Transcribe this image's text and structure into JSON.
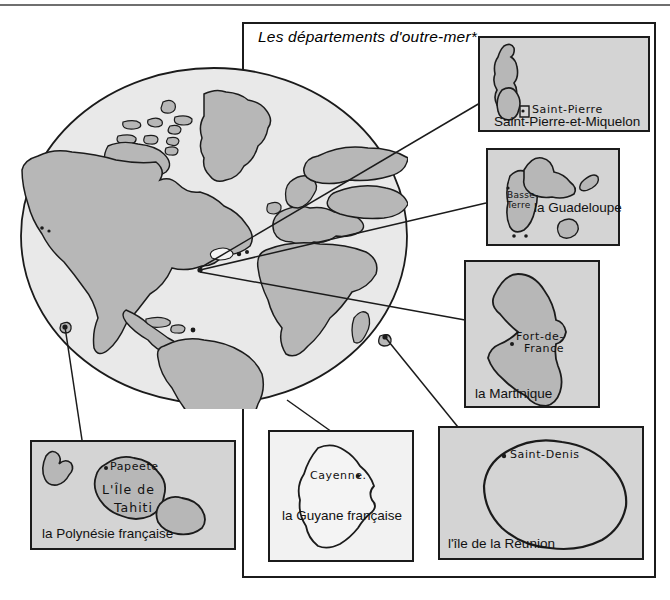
{
  "figure": {
    "title": "Les départements d'outre-mer*",
    "globe_name": "world-globe"
  },
  "insets": [
    {
      "id": "saint-pierre-et-miquelon",
      "label": "Saint-Pierre-et-Miquelon",
      "city": "Saint-Pierre",
      "fill": "#d4d4d4"
    },
    {
      "id": "guadeloupe",
      "label": "la Guadeloupe",
      "city": "Basse-\nTerre",
      "city_line1": "Basse-",
      "city_line2": "Terre",
      "fill": "#d4d4d4"
    },
    {
      "id": "martinique",
      "label": "la Martinique",
      "city_line1": "Fort-de-",
      "city_line2": "France",
      "fill": "#d4d4d4"
    },
    {
      "id": "polynesie-francaise",
      "label": "la Polynésie française",
      "city": "Papeete",
      "island_line1": "L'Île de",
      "island_line2": "Tahiti",
      "fill": "#d4d4d4"
    },
    {
      "id": "guyane-francaise",
      "label": "la Guyane française",
      "city": "Cayenne.",
      "fill": "#e9e9e9"
    },
    {
      "id": "reunion",
      "label": "l'île de la Réunion",
      "city": "Saint-Denis",
      "fill": "#d4d4d4"
    }
  ],
  "colors": {
    "land": "#b7b7b7",
    "ocean": "#e4e4e4",
    "ink": "#1b1b1b",
    "inset_bg": "#d4d4d4",
    "page": "#ffffff"
  }
}
